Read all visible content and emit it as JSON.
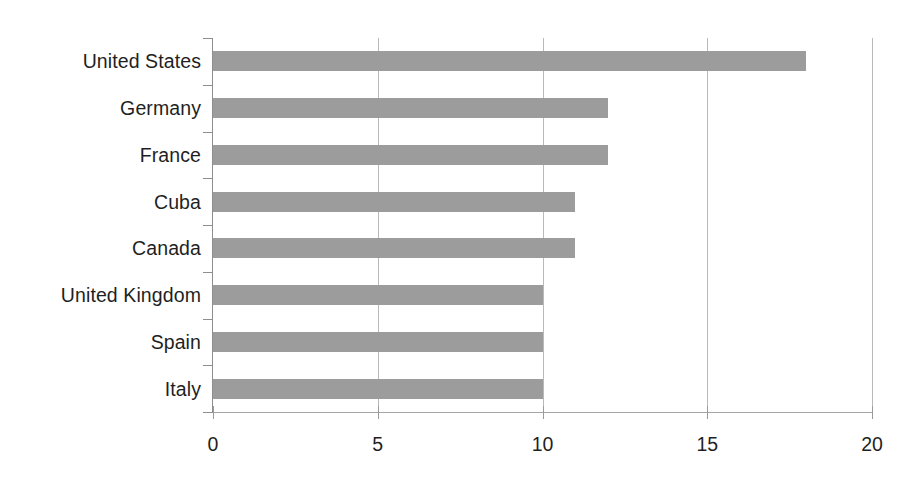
{
  "chart_data": {
    "type": "bar",
    "orientation": "horizontal",
    "title": "",
    "subtitle": "",
    "xlabel": "",
    "ylabel": "",
    "categories": [
      "United States",
      "Germany",
      "France",
      "Cuba",
      "Canada",
      "United Kingdom",
      "Spain",
      "Italy"
    ],
    "values": [
      18,
      12,
      12,
      11,
      11,
      10,
      10,
      10
    ],
    "series": [
      {
        "name": "",
        "values": [
          18,
          12,
          12,
          11,
          11,
          10,
          10,
          10
        ]
      }
    ],
    "xlim": [
      0,
      20
    ],
    "xticks": [
      0,
      5,
      10,
      15,
      20
    ],
    "xtick_labels": [
      "0",
      "5",
      "10",
      "15",
      "20"
    ],
    "grid": {
      "vertical": true,
      "horizontal": false,
      "positions": [
        5,
        10,
        15,
        20
      ]
    },
    "legend": {
      "visible": false,
      "position": "none",
      "entries": []
    },
    "colors": {
      "bar": "#9c9c9c",
      "gridline": "#b9b9b9",
      "axis": "#8e8e8e",
      "text": "#1f1f1f",
      "background": "#ffffff"
    },
    "annotations": []
  }
}
